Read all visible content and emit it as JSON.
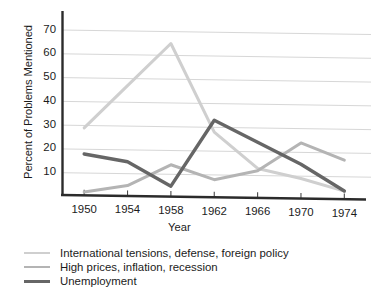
{
  "chart_data": {
    "type": "line",
    "title": "",
    "xlabel": "Year",
    "ylabel": "Percent of Problems Mentioned",
    "x": [
      1950,
      1954,
      1958,
      1962,
      1966,
      1970,
      1974
    ],
    "categories": [
      "1950",
      "1954",
      "1958",
      "1962",
      "1966",
      "1970",
      "1974"
    ],
    "xlim": [
      1948,
      1976
    ],
    "ylim": [
      0,
      74
    ],
    "yticks": [
      10,
      20,
      30,
      40,
      50,
      60,
      70
    ],
    "ytick_labels": [
      "10",
      "20",
      "30",
      "40",
      "50",
      "60",
      "70"
    ],
    "grid": true,
    "grid_axis": "y",
    "legend_position": "below-left",
    "series": [
      {
        "name": "International tensions, defense, foreign policy",
        "color": "#cfcfcf",
        "values": [
          29,
          47,
          65,
          28,
          13,
          9,
          4
        ]
      },
      {
        "name": "High prices, inflation, recession",
        "color": "#b4b4b4",
        "values": [
          2,
          5,
          14,
          8,
          12,
          24,
          17
        ]
      },
      {
        "name": "Unemployment",
        "color": "#666666",
        "values": [
          18,
          15,
          5,
          33,
          24,
          15,
          4
        ]
      }
    ]
  },
  "axes": {
    "y_title": "Percent of Problems Mentioned",
    "x_title": "Year"
  },
  "legend": {
    "items": [
      {
        "label": "International tensions, defense, foreign policy",
        "color": "#cfcfcf"
      },
      {
        "label": "High prices, inflation, recession",
        "color": "#b4b4b4"
      },
      {
        "label": "Unemployment",
        "color": "#666666"
      }
    ]
  }
}
